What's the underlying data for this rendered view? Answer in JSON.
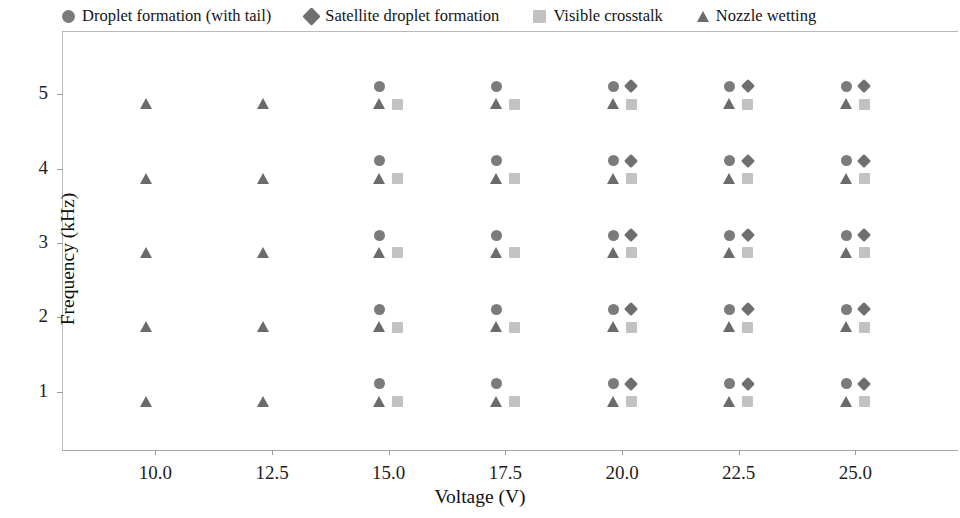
{
  "chart_data": {
    "type": "scatter",
    "title": "",
    "xlabel": "Voltage (V)",
    "ylabel": "Frequency (kHz)",
    "xlim": [
      8.0,
      27.2
    ],
    "ylim": [
      0.2,
      5.85
    ],
    "xticks": [
      10.0,
      12.5,
      15.0,
      17.5,
      20.0,
      22.5,
      25.0
    ],
    "xticklabels": [
      "10.0",
      "12.5",
      "15.0",
      "17.5",
      "20.0",
      "22.5",
      "25.0"
    ],
    "yticks": [
      1,
      2,
      3,
      4,
      5
    ],
    "yticklabels": [
      "1",
      "2",
      "3",
      "4",
      "5"
    ],
    "grid": false,
    "legend_position": "top",
    "series": [
      {
        "name": "Droplet formation (with tail)",
        "marker": "circle",
        "color": "#7b7b7b",
        "dx": -9,
        "dy": 0.105,
        "points": [
          {
            "x": 15.0,
            "y": 1
          },
          {
            "x": 15.0,
            "y": 2
          },
          {
            "x": 15.0,
            "y": 3
          },
          {
            "x": 15.0,
            "y": 4
          },
          {
            "x": 15.0,
            "y": 5
          },
          {
            "x": 17.5,
            "y": 1
          },
          {
            "x": 17.5,
            "y": 2
          },
          {
            "x": 17.5,
            "y": 3
          },
          {
            "x": 17.5,
            "y": 4
          },
          {
            "x": 17.5,
            "y": 5
          },
          {
            "x": 20.0,
            "y": 1
          },
          {
            "x": 20.0,
            "y": 2
          },
          {
            "x": 20.0,
            "y": 3
          },
          {
            "x": 20.0,
            "y": 4
          },
          {
            "x": 20.0,
            "y": 5
          },
          {
            "x": 22.5,
            "y": 1
          },
          {
            "x": 22.5,
            "y": 2
          },
          {
            "x": 22.5,
            "y": 3
          },
          {
            "x": 22.5,
            "y": 4
          },
          {
            "x": 22.5,
            "y": 5
          },
          {
            "x": 25.0,
            "y": 1
          },
          {
            "x": 25.0,
            "y": 2
          },
          {
            "x": 25.0,
            "y": 3
          },
          {
            "x": 25.0,
            "y": 4
          },
          {
            "x": 25.0,
            "y": 5
          }
        ]
      },
      {
        "name": "Satellite droplet formation",
        "marker": "diamond",
        "color": "#6f6f6f",
        "dx": 9,
        "dy": 0.105,
        "points": [
          {
            "x": 20.0,
            "y": 1
          },
          {
            "x": 20.0,
            "y": 2
          },
          {
            "x": 20.0,
            "y": 3
          },
          {
            "x": 20.0,
            "y": 4
          },
          {
            "x": 20.0,
            "y": 5
          },
          {
            "x": 22.5,
            "y": 1
          },
          {
            "x": 22.5,
            "y": 2
          },
          {
            "x": 22.5,
            "y": 3
          },
          {
            "x": 22.5,
            "y": 4
          },
          {
            "x": 22.5,
            "y": 5
          },
          {
            "x": 25.0,
            "y": 1
          },
          {
            "x": 25.0,
            "y": 2
          },
          {
            "x": 25.0,
            "y": 3
          },
          {
            "x": 25.0,
            "y": 4
          },
          {
            "x": 25.0,
            "y": 5
          }
        ]
      },
      {
        "name": "Visible crosstalk",
        "marker": "square",
        "color": "#c2c2c2",
        "dx": 9,
        "dy": -0.135,
        "points": [
          {
            "x": 15.0,
            "y": 1
          },
          {
            "x": 15.0,
            "y": 2
          },
          {
            "x": 15.0,
            "y": 3
          },
          {
            "x": 15.0,
            "y": 4
          },
          {
            "x": 15.0,
            "y": 5
          },
          {
            "x": 17.5,
            "y": 1
          },
          {
            "x": 17.5,
            "y": 2
          },
          {
            "x": 17.5,
            "y": 3
          },
          {
            "x": 17.5,
            "y": 4
          },
          {
            "x": 17.5,
            "y": 5
          },
          {
            "x": 20.0,
            "y": 1
          },
          {
            "x": 20.0,
            "y": 2
          },
          {
            "x": 20.0,
            "y": 3
          },
          {
            "x": 20.0,
            "y": 4
          },
          {
            "x": 20.0,
            "y": 5
          },
          {
            "x": 22.5,
            "y": 1
          },
          {
            "x": 22.5,
            "y": 2
          },
          {
            "x": 22.5,
            "y": 3
          },
          {
            "x": 22.5,
            "y": 4
          },
          {
            "x": 22.5,
            "y": 5
          },
          {
            "x": 25.0,
            "y": 1
          },
          {
            "x": 25.0,
            "y": 2
          },
          {
            "x": 25.0,
            "y": 3
          },
          {
            "x": 25.0,
            "y": 4
          },
          {
            "x": 25.0,
            "y": 5
          }
        ]
      },
      {
        "name": "Nozzle wetting",
        "marker": "triangle",
        "color": "#6b6b6b",
        "dx": -9,
        "dy": -0.135,
        "points": [
          {
            "x": 10.0,
            "y": 1
          },
          {
            "x": 10.0,
            "y": 2
          },
          {
            "x": 10.0,
            "y": 3
          },
          {
            "x": 10.0,
            "y": 4
          },
          {
            "x": 10.0,
            "y": 5
          },
          {
            "x": 12.5,
            "y": 1
          },
          {
            "x": 12.5,
            "y": 2
          },
          {
            "x": 12.5,
            "y": 3
          },
          {
            "x": 12.5,
            "y": 4
          },
          {
            "x": 12.5,
            "y": 5
          },
          {
            "x": 15.0,
            "y": 1
          },
          {
            "x": 15.0,
            "y": 2
          },
          {
            "x": 15.0,
            "y": 3
          },
          {
            "x": 15.0,
            "y": 4
          },
          {
            "x": 15.0,
            "y": 5
          },
          {
            "x": 17.5,
            "y": 1
          },
          {
            "x": 17.5,
            "y": 2
          },
          {
            "x": 17.5,
            "y": 3
          },
          {
            "x": 17.5,
            "y": 4
          },
          {
            "x": 17.5,
            "y": 5
          },
          {
            "x": 20.0,
            "y": 1
          },
          {
            "x": 20.0,
            "y": 2
          },
          {
            "x": 20.0,
            "y": 3
          },
          {
            "x": 20.0,
            "y": 4
          },
          {
            "x": 20.0,
            "y": 5
          },
          {
            "x": 22.5,
            "y": 1
          },
          {
            "x": 22.5,
            "y": 2
          },
          {
            "x": 22.5,
            "y": 3
          },
          {
            "x": 22.5,
            "y": 4
          },
          {
            "x": 22.5,
            "y": 5
          },
          {
            "x": 25.0,
            "y": 1
          },
          {
            "x": 25.0,
            "y": 2
          },
          {
            "x": 25.0,
            "y": 3
          },
          {
            "x": 25.0,
            "y": 4
          },
          {
            "x": 25.0,
            "y": 5
          }
        ]
      }
    ]
  }
}
